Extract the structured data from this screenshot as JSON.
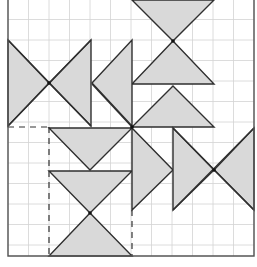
{
  "diagram": {
    "title": "",
    "colors": {
      "background": "#ffffff",
      "grid": "#d3d3d3",
      "shape_fill": "#d9d9d9",
      "shape_stroke": "#2f2f2f",
      "border": "#555555"
    },
    "grid": {
      "x0": 8,
      "y0": -1,
      "step": 20.5,
      "cols": 12,
      "rows": 13,
      "left": 8,
      "right": 254,
      "top": 0,
      "bottom": 256
    },
    "triangles": [
      {
        "id": "top-down-triangle",
        "points": "132,0 214,0 173,41"
      },
      {
        "id": "upper-up-triangle-1",
        "points": "173,41 132,84 214,84"
      },
      {
        "id": "upper-up-triangle-2",
        "points": "173,86 132,127 214,127"
      },
      {
        "id": "left-bowtie-left",
        "points": "8,40 8,126 49,83"
      },
      {
        "id": "left-bowtie-right",
        "points": "91,40 91,126 49,83"
      },
      {
        "id": "left-pointing-triangle",
        "points": "132,40 132,126 92,83"
      },
      {
        "id": "mid-down-triangle",
        "points": "49,128 132,128 90,170"
      },
      {
        "id": "lower-down-triangle",
        "points": "49,171 132,171 90,213"
      },
      {
        "id": "bottom-up-triangle",
        "points": "90,213 49,256 132,256"
      },
      {
        "id": "right-pointing-triangle-1",
        "points": "132,128 132,210 173,170"
      },
      {
        "id": "right-pointing-triangle-2",
        "points": "173,128 173,210 214,170"
      },
      {
        "id": "left-pointing-triangle-edge",
        "points": "214,170 254,128 254,210"
      }
    ],
    "edges": [
      {
        "id": "bowtie-diag-1",
        "x1": 8,
        "y1": 40,
        "x2": 91,
        "y2": 126
      },
      {
        "id": "bowtie-diag-2",
        "x1": 8,
        "y1": 126,
        "x2": 91,
        "y2": 40
      },
      {
        "id": "center-link",
        "x1": 92,
        "y1": 84,
        "x2": 132,
        "y2": 127
      },
      {
        "id": "right-x-diag-1",
        "x1": 173,
        "y1": 128,
        "x2": 254,
        "y2": 210
      },
      {
        "id": "right-x-diag-2",
        "x1": 173,
        "y1": 210,
        "x2": 254,
        "y2": 128
      }
    ],
    "dashed": [
      {
        "id": "dashed-horizontal",
        "x1": 8,
        "y1": 127,
        "x2": 49,
        "y2": 127
      },
      {
        "id": "dashed-left-vertical",
        "x1": 49,
        "y1": 127,
        "x2": 49,
        "y2": 256
      },
      {
        "id": "dashed-right-vertical",
        "x1": 132,
        "y1": 210,
        "x2": 132,
        "y2": 256
      }
    ],
    "nodes": [
      {
        "id": "node-left-x",
        "cx": 49,
        "cy": 83
      },
      {
        "id": "node-center",
        "cx": 132,
        "cy": 127
      },
      {
        "id": "node-top-neck",
        "cx": 173,
        "cy": 41
      },
      {
        "id": "node-right-x",
        "cx": 214,
        "cy": 170
      },
      {
        "id": "node-lower-neck",
        "cx": 90,
        "cy": 213
      }
    ]
  }
}
